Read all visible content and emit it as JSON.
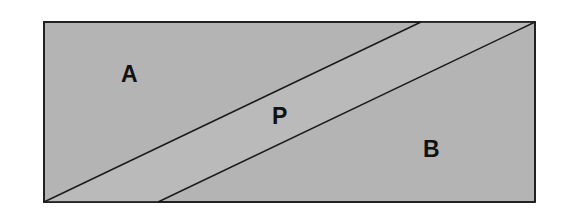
{
  "diagram": {
    "title": "",
    "regions": [
      {
        "id": "A",
        "label": "A"
      },
      {
        "id": "P",
        "label": "P"
      },
      {
        "id": "B",
        "label": "B"
      }
    ],
    "colors": {
      "fill": "#b4b4b4",
      "stroke": "#1a1a1a",
      "background": "#ffffff"
    },
    "geometry": {
      "rectangle": {
        "x": 44,
        "y": 22,
        "width": 491,
        "height": 180
      },
      "line1": {
        "x1": 44,
        "y1": 202,
        "x2": 421,
        "y2": 22
      },
      "line2": {
        "x1": 158,
        "y1": 202,
        "x2": 535,
        "y2": 22
      }
    }
  }
}
